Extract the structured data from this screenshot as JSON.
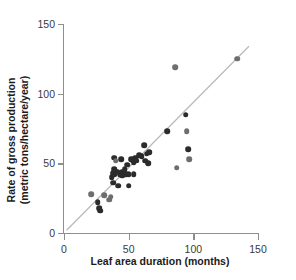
{
  "chart_data": {
    "type": "scatter",
    "title": "",
    "xlabel": "Leaf area duration (months)",
    "ylabel_line1": "Rate of gross production",
    "ylabel_line2": "(metric tons/hectare/year)",
    "xlim": [
      0,
      150
    ],
    "ylim": [
      0,
      150
    ],
    "xticks": [
      0,
      50,
      100,
      150
    ],
    "yticks": [
      0,
      50,
      100,
      150
    ],
    "xticklabels": [
      "0",
      "50",
      "100",
      "150"
    ],
    "yticklabels": [
      "0",
      "50",
      "100",
      "150"
    ],
    "grid": false,
    "legend": "none",
    "marker_colors": {
      "dark": "#2b2b2b",
      "mid": "#6e6e6e",
      "light": "#a0a0a0"
    },
    "trendline": {
      "type": "linear",
      "x_start": 2,
      "y_start": 2,
      "x_end": 143,
      "y_end": 134,
      "color": "#b9b9b9",
      "width": 1.2
    },
    "axis_color": "#8e8e8e",
    "points": [
      {
        "x": 21,
        "y": 28,
        "shade": "mid"
      },
      {
        "x": 26,
        "y": 22,
        "shade": "dark"
      },
      {
        "x": 27,
        "y": 18,
        "shade": "dark"
      },
      {
        "x": 28,
        "y": 16,
        "shade": "dark"
      },
      {
        "x": 31,
        "y": 27,
        "shade": "mid"
      },
      {
        "x": 35,
        "y": 24,
        "shade": "mid"
      },
      {
        "x": 36,
        "y": 26,
        "shade": "mid"
      },
      {
        "x": 37,
        "y": 40,
        "shade": "dark"
      },
      {
        "x": 38,
        "y": 43,
        "shade": "dark"
      },
      {
        "x": 38,
        "y": 36,
        "shade": "dark"
      },
      {
        "x": 39,
        "y": 54,
        "shade": "dark"
      },
      {
        "x": 39,
        "y": 46,
        "shade": "dark"
      },
      {
        "x": 39,
        "y": 42,
        "shade": "dark"
      },
      {
        "x": 40,
        "y": 52,
        "shade": "mid"
      },
      {
        "x": 41,
        "y": 44,
        "shade": "dark"
      },
      {
        "x": 42,
        "y": 34,
        "shade": "dark"
      },
      {
        "x": 43,
        "y": 42,
        "shade": "dark"
      },
      {
        "x": 44,
        "y": 53,
        "shade": "dark"
      },
      {
        "x": 45,
        "y": 44,
        "shade": "dark"
      },
      {
        "x": 45,
        "y": 41,
        "shade": "dark"
      },
      {
        "x": 46,
        "y": 43,
        "shade": "dark"
      },
      {
        "x": 47,
        "y": 46,
        "shade": "dark"
      },
      {
        "x": 48,
        "y": 42,
        "shade": "dark"
      },
      {
        "x": 49,
        "y": 49,
        "shade": "dark"
      },
      {
        "x": 50,
        "y": 42,
        "shade": "dark"
      },
      {
        "x": 50,
        "y": 34,
        "shade": "dark"
      },
      {
        "x": 52,
        "y": 53,
        "shade": "dark"
      },
      {
        "x": 53,
        "y": 52,
        "shade": "dark"
      },
      {
        "x": 54,
        "y": 51,
        "shade": "dark"
      },
      {
        "x": 54,
        "y": 42,
        "shade": "dark"
      },
      {
        "x": 55,
        "y": 54,
        "shade": "dark"
      },
      {
        "x": 56,
        "y": 52,
        "shade": "dark"
      },
      {
        "x": 58,
        "y": 56,
        "shade": "dark"
      },
      {
        "x": 60,
        "y": 55,
        "shade": "dark"
      },
      {
        "x": 62,
        "y": 63,
        "shade": "dark"
      },
      {
        "x": 63,
        "y": 52,
        "shade": "dark"
      },
      {
        "x": 64,
        "y": 57,
        "shade": "dark"
      },
      {
        "x": 65,
        "y": 50,
        "shade": "dark"
      },
      {
        "x": 66,
        "y": 58,
        "shade": "dark"
      },
      {
        "x": 80,
        "y": 73,
        "shade": "dark"
      },
      {
        "x": 86,
        "y": 119,
        "shade": "mid"
      },
      {
        "x": 87,
        "y": 47,
        "shade": "mid"
      },
      {
        "x": 94,
        "y": 85,
        "shade": "dark"
      },
      {
        "x": 95,
        "y": 73,
        "shade": "mid"
      },
      {
        "x": 96,
        "y": 60,
        "shade": "dark"
      },
      {
        "x": 97,
        "y": 53,
        "shade": "mid"
      },
      {
        "x": 134,
        "y": 125,
        "shade": "mid"
      }
    ]
  }
}
